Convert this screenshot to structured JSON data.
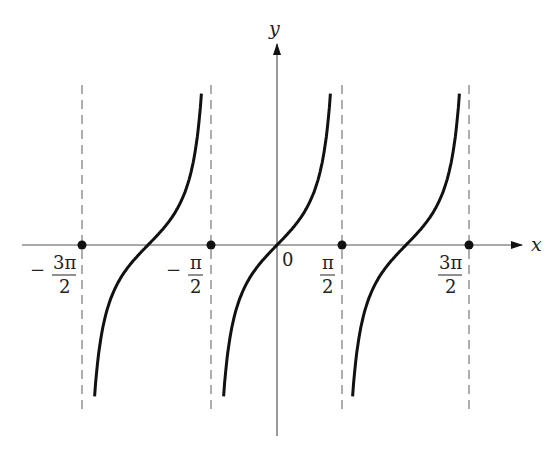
{
  "figure": {
    "function": "tan x",
    "axes": {
      "x_label": "x",
      "y_label": "y",
      "origin_label": "0"
    },
    "tick_labels": [
      {
        "sign": "−",
        "num": "3π",
        "den": "2",
        "value": "-3π/2"
      },
      {
        "sign": "−",
        "num": "π",
        "den": "2",
        "value": "-π/2"
      },
      {
        "sign": "",
        "num": "π",
        "den": "2",
        "value": "π/2"
      },
      {
        "sign": "",
        "num": "3π",
        "den": "2",
        "value": "3π/2"
      }
    ],
    "asymptotes": [
      "-3π/2",
      "-π/2",
      "π/2",
      "3π/2"
    ],
    "colors": {
      "curve": "#111111",
      "axis": "#555555",
      "asymptote": "#777777",
      "point": "#111111"
    }
  },
  "chart_data": {
    "type": "line",
    "title": "",
    "xlabel": "x",
    "ylabel": "y",
    "x_ticks": [
      "-3π/2",
      "-π/2",
      "0",
      "π/2",
      "3π/2"
    ],
    "vertical_asymptotes": [
      -4.712,
      -1.571,
      1.571,
      4.712
    ],
    "marked_points": [
      [
        -4.712,
        0
      ],
      [
        -1.571,
        0
      ],
      [
        1.571,
        0
      ],
      [
        4.712,
        0
      ]
    ],
    "series": [
      {
        "name": "tan x branch 1",
        "x_range": [
          -4.712,
          -1.571
        ],
        "zero_at": -3.1416
      },
      {
        "name": "tan x branch 2",
        "x_range": [
          -1.571,
          1.571
        ],
        "zero_at": 0
      },
      {
        "name": "tan x branch 3",
        "x_range": [
          1.571,
          4.712
        ],
        "zero_at": 3.1416
      }
    ],
    "grid": false,
    "legend": "none"
  }
}
